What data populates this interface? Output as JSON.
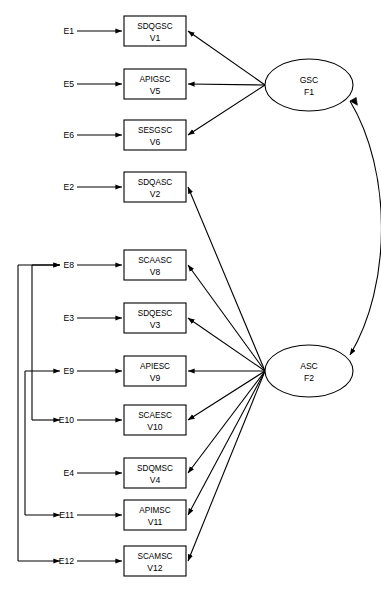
{
  "diagram": {
    "type": "structural-equation-model-path-diagram",
    "title": "",
    "colors": {
      "stroke": "#000000",
      "fill": "#ffffff",
      "background": "#ffffff"
    },
    "factors": [
      {
        "id": "F1",
        "name": "GSC",
        "code": "F1",
        "cx": 309,
        "cy": 85,
        "rx": 44,
        "ry": 26
      },
      {
        "id": "F2",
        "name": "ASC",
        "code": "F2",
        "cx": 309,
        "cy": 371,
        "rx": 44,
        "ry": 26
      }
    ],
    "indicators": [
      {
        "id": "V1",
        "label": "SDQGSC",
        "var": "V1",
        "error": "E1",
        "x": 124,
        "y": 16,
        "w": 62,
        "h": 30,
        "factor": "F1"
      },
      {
        "id": "V5",
        "label": "APIGSC",
        "var": "V5",
        "error": "E5",
        "x": 124,
        "y": 69,
        "w": 62,
        "h": 30,
        "factor": "F1"
      },
      {
        "id": "V6",
        "label": "SESGSC",
        "var": "V6",
        "error": "E6",
        "x": 124,
        "y": 120,
        "w": 62,
        "h": 30,
        "factor": "F1"
      },
      {
        "id": "V2",
        "label": "SDQASC",
        "var": "V2",
        "error": "E2",
        "x": 124,
        "y": 172,
        "w": 62,
        "h": 30,
        "factor": "F2"
      },
      {
        "id": "V8",
        "label": "SCAASC",
        "var": "V8",
        "error": "E8",
        "x": 124,
        "y": 250,
        "w": 62,
        "h": 30,
        "factor": "F2"
      },
      {
        "id": "V3",
        "label": "SDQESC",
        "var": "V3",
        "error": "E3",
        "x": 124,
        "y": 303,
        "w": 62,
        "h": 30,
        "factor": "F2"
      },
      {
        "id": "V9",
        "label": "APIESC",
        "var": "V9",
        "error": "E9",
        "x": 124,
        "y": 356,
        "w": 62,
        "h": 30,
        "factor": "F2"
      },
      {
        "id": "V10",
        "label": "SCAESC",
        "var": "V10",
        "error": "E10",
        "x": 124,
        "y": 405,
        "w": 62,
        "h": 30,
        "factor": "F2"
      },
      {
        "id": "V4",
        "label": "SDQMSC",
        "var": "V4",
        "error": "E4",
        "x": 124,
        "y": 458,
        "w": 62,
        "h": 30,
        "factor": "F2"
      },
      {
        "id": "V11",
        "label": "APIMSC",
        "var": "V11",
        "error": "E11",
        "x": 124,
        "y": 500,
        "w": 62,
        "h": 30,
        "factor": "F2"
      },
      {
        "id": "V12",
        "label": "SCAMSC",
        "var": "V12",
        "error": "E12",
        "x": 124,
        "y": 546,
        "w": 62,
        "h": 30,
        "factor": "F2"
      }
    ],
    "error_correlations": [
      {
        "from": "E8",
        "to": "E12",
        "bracket_x": 18
      },
      {
        "from": "E9",
        "to": "E11",
        "bracket_x": 25
      },
      {
        "from": "E8",
        "to": "E10",
        "bracket_x": 32
      }
    ],
    "factor_correlation": {
      "from": "F1",
      "to": "F2",
      "double_headed": true
    }
  }
}
